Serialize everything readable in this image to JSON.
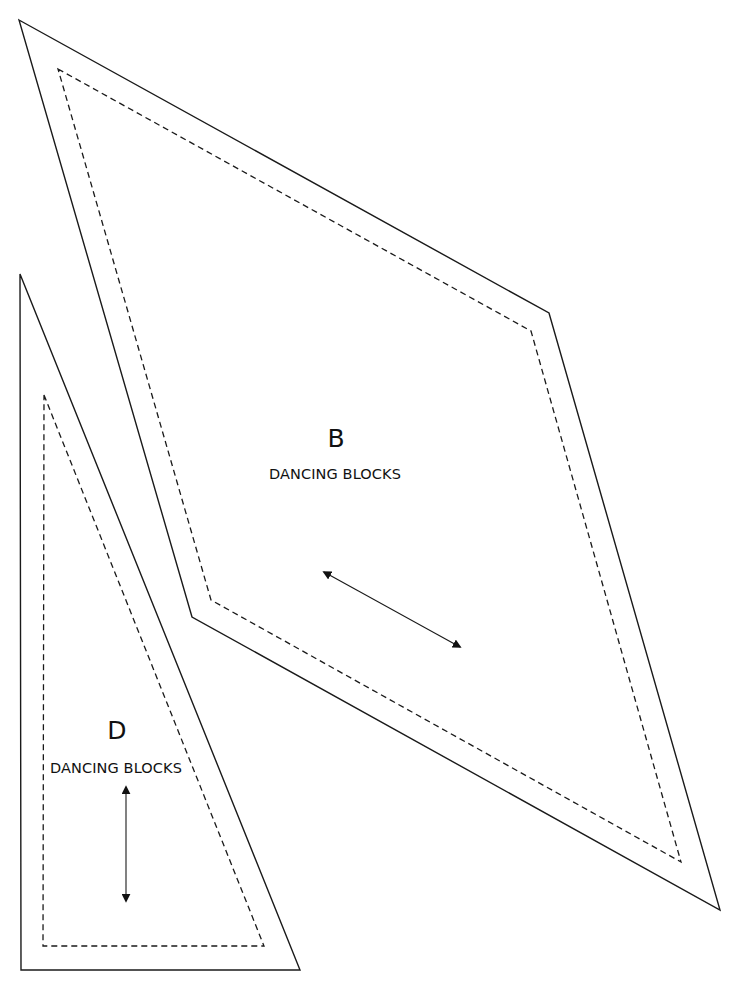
{
  "canvas": {
    "width": 730,
    "height": 992,
    "background": "#ffffff",
    "line_color": "#1a1a1a"
  },
  "pieces": [
    {
      "id": "B",
      "letter": "B",
      "name": "DANCING BLOCKS",
      "shape": "parallelogram",
      "outer_points": "19,20 549,313 720,910 192,617",
      "inner_points": "58,69 531,331 681,862 211,600",
      "letter_pos": {
        "x": 336,
        "y": 426
      },
      "name_pos": {
        "x": 335,
        "y": 467
      },
      "grain_arrow": {
        "x1": 324,
        "y1": 572,
        "x2": 460,
        "y2": 647
      }
    },
    {
      "id": "D",
      "letter": "D",
      "name": "DANCING BLOCKS",
      "shape": "triangle",
      "outer_points": "20,274 300,970 21,970",
      "inner_points": "44,395 264,946 43,946",
      "letter_pos": {
        "x": 117,
        "y": 718
      },
      "name_pos": {
        "x": 116,
        "y": 761
      },
      "grain_arrow": {
        "x1": 126,
        "y1": 787,
        "x2": 126,
        "y2": 901
      }
    }
  ],
  "legend": {
    "outer_line": "cutting line (solid)",
    "inner_line": "seam line (dashed)",
    "arrow": "grain line (double-headed arrow)"
  }
}
